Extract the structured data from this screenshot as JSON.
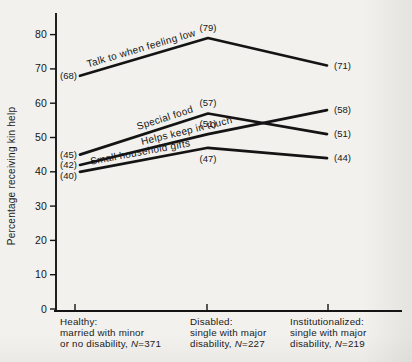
{
  "figure": {
    "background": "#f2f1ed",
    "ink": "#141414"
  },
  "y_axis": {
    "title": "Percentage receiving kin help",
    "tick_labels": [
      "0",
      "10",
      "20",
      "30",
      "40",
      "50",
      "60",
      "70",
      "80"
    ],
    "ticks": [
      0,
      10,
      20,
      30,
      40,
      50,
      60,
      70,
      80
    ]
  },
  "x_axis": {
    "categories": [
      {
        "lines": [
          "Healthy:",
          "married with minor",
          "or no disability, N=371"
        ]
      },
      {
        "lines": [
          "Disabled:",
          "single with major",
          "disability, N=227"
        ]
      },
      {
        "lines": [
          "Institutionalized:",
          "single with major",
          "disability, N=219"
        ]
      }
    ]
  },
  "chart_data": {
    "type": "line",
    "title": "",
    "xlabel": "",
    "ylabel": "Percentage receiving kin help",
    "ylim": [
      0,
      86
    ],
    "grid": false,
    "legend_position": "inline-labels-on-lines",
    "point_label_format": "(value)",
    "categories": [
      "Healthy: married with minor or no disability, N=371",
      "Disabled: single with major disability, N=227",
      "Institutionalized: single with major disability, N=219"
    ],
    "series": [
      {
        "id": "talk",
        "name": "Talk to when feeling low",
        "values": [
          68,
          79,
          71
        ]
      },
      {
        "id": "special-food",
        "name": "Special food",
        "values": [
          45,
          57,
          51
        ]
      },
      {
        "id": "keep-in-touch",
        "name": "Helps keep in touch",
        "values": [
          42,
          51,
          58
        ]
      },
      {
        "id": "gifts",
        "name": "Small household gifts",
        "values": [
          40,
          47,
          44
        ]
      }
    ]
  }
}
